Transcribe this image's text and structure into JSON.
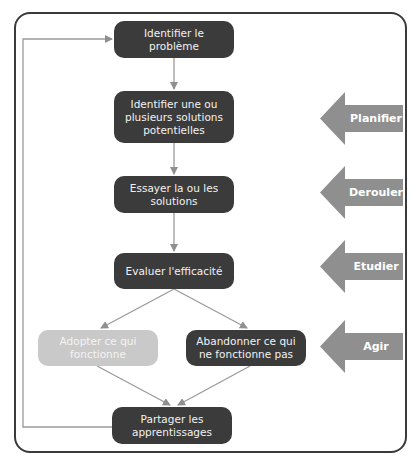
{
  "flowchart": {
    "steps": [
      {
        "id": "identify",
        "label": "Identifier le problème",
        "style": "dark"
      },
      {
        "id": "solutions",
        "label": "Identifier une ou plusieurs solutions potentielles",
        "style": "dark"
      },
      {
        "id": "try",
        "label": "Essayer la ou les solutions",
        "style": "dark"
      },
      {
        "id": "evaluate",
        "label": "Evaluer l'efficacité",
        "style": "dark"
      },
      {
        "id": "adopt",
        "label": "Adopter ce qui fonctionne",
        "style": "light"
      },
      {
        "id": "abandon",
        "label": "Abandonner ce qui ne fonctionne pas",
        "style": "dark"
      },
      {
        "id": "share",
        "label": "Partager les apprentissages",
        "style": "dark"
      }
    ],
    "phases": [
      {
        "label": "Planifier"
      },
      {
        "label": "Derouler"
      },
      {
        "label": "Etudier"
      },
      {
        "label": "Agir"
      }
    ],
    "colors": {
      "dark_box": "#3b3b3b",
      "light_box": "#c9c9c9",
      "arrow": "#8f8f8f",
      "connector": "#9a9a9a",
      "frame": "#3a3a3a"
    }
  }
}
